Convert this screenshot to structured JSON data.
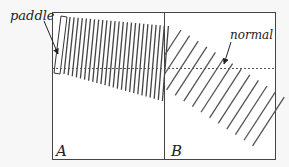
{
  "labels": {
    "paddle": "paddle",
    "normal": "normal",
    "region_a": "A",
    "region_b": "B"
  },
  "colors": {
    "background": "#f7f7f7",
    "box_fill": "#ffffff",
    "box_stroke": "#444444",
    "wave_line": "#444444",
    "normal_line": "#555555",
    "text": "#222222"
  },
  "diagram": {
    "box": {
      "x": 52,
      "y": 12,
      "width": 224,
      "height": 148
    },
    "boundary_x": 164,
    "normal_y": 68,
    "region_a_wave_count": 25,
    "region_b_wave_count": 13
  }
}
